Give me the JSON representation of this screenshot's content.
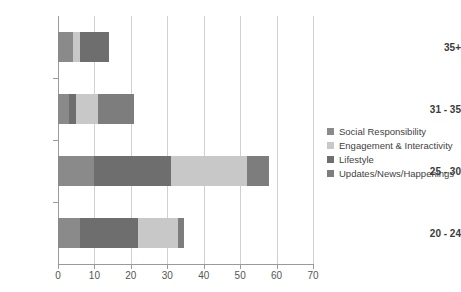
{
  "chart_data": {
    "type": "bar",
    "orientation": "horizontal",
    "stacked": true,
    "title": "",
    "xlabel": "",
    "ylabel": "",
    "xlim": [
      0,
      70
    ],
    "xticks": [
      0,
      10,
      20,
      30,
      40,
      50,
      60,
      70
    ],
    "xtick_labels": [
      "0",
      "10",
      "20",
      "30",
      "40",
      "50",
      "60",
      "70"
    ],
    "grid": true,
    "grid_axis": "x",
    "legend_position": "right",
    "categories": [
      "35+",
      "31 - 35",
      "25 - 30",
      "20 - 24"
    ],
    "series": [
      {
        "name": "Social Responsibility",
        "color": "#8a8a8a",
        "values": [
          4,
          3,
          10,
          6
        ]
      },
      {
        "name": "Engagement & Interactivity",
        "color": "#c8c8c8",
        "values": [
          2,
          0,
          0,
          0
        ]
      },
      {
        "name": "Lifestyle",
        "color": "#6e6e6e",
        "values": [
          8,
          2,
          20,
          16
        ]
      },
      {
        "name": "Updates/News/Happenings",
        "color": "#8a8a8a",
        "values": [
          0,
          0,
          0,
          0
        ]
      }
    ],
    "stack_order_per_category": {
      "35+": [
        {
          "series": "Social Responsibility",
          "color": "#8a8a8a",
          "start": 0,
          "end": 4
        },
        {
          "series": "Engagement & Interactivity",
          "color": "#c8c8c8",
          "start": 4,
          "end": 6
        },
        {
          "series": "Lifestyle",
          "color": "#6e6e6e",
          "start": 6,
          "end": 14
        }
      ],
      "31 - 35": [
        {
          "series": "Social Responsibility",
          "color": "#8a8a8a",
          "start": 0,
          "end": 3
        },
        {
          "series": "Lifestyle",
          "color": "#6e6e6e",
          "start": 3,
          "end": 5
        },
        {
          "series": "Engagement & Interactivity",
          "color": "#c8c8c8",
          "start": 5,
          "end": 11
        },
        {
          "series": "Updates/News/Happenings",
          "color": "#7d7d7d",
          "start": 11,
          "end": 21
        }
      ],
      "25 - 30": [
        {
          "series": "Social Responsibility",
          "color": "#8a8a8a",
          "start": 0,
          "end": 10
        },
        {
          "series": "Lifestyle",
          "color": "#6e6e6e",
          "start": 10,
          "end": 31
        },
        {
          "series": "Engagement & Interactivity",
          "color": "#c8c8c8",
          "start": 31,
          "end": 52
        },
        {
          "series": "Updates/News/Happenings",
          "color": "#7d7d7d",
          "start": 52,
          "end": 58
        }
      ],
      "20 - 24": [
        {
          "series": "Social Responsibility",
          "color": "#8a8a8a",
          "start": 0,
          "end": 6
        },
        {
          "series": "Lifestyle",
          "color": "#6e6e6e",
          "start": 6,
          "end": 22
        },
        {
          "series": "Engagement & Interactivity",
          "color": "#c8c8c8",
          "start": 22,
          "end": 33
        },
        {
          "series": "Updates/News/Happenings",
          "color": "#7d7d7d",
          "start": 33,
          "end": 34.5
        }
      ]
    },
    "category_totals": [
      14,
      21,
      58,
      34.5
    ]
  },
  "legend": {
    "items": [
      {
        "label": "Social Responsibility",
        "color": "#8a8a8a"
      },
      {
        "label": "Engagement & Interactivity",
        "color": "#c8c8c8"
      },
      {
        "label": "Lifestyle",
        "color": "#6e6e6e"
      },
      {
        "label": "Updates/News/Happenings",
        "color": "#7d7d7d"
      }
    ]
  },
  "axes": {
    "x_tick_labels": [
      "0",
      "10",
      "20",
      "30",
      "40",
      "50",
      "60",
      "70"
    ],
    "y_tick_labels": [
      "35+",
      "31 - 35",
      "25 - 30",
      "20 - 24"
    ]
  }
}
